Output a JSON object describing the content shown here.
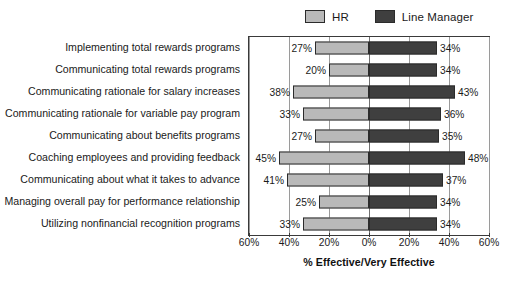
{
  "chart_data": {
    "type": "bar",
    "orientation": "horizontal-diverging",
    "title": "",
    "subtitle": "",
    "xlabel": "% Effective/Very Effective",
    "ylabel": "",
    "xlim": [
      -60,
      60
    ],
    "xticks": [
      60,
      40,
      20,
      0,
      20,
      40,
      60
    ],
    "xtick_labels": [
      "60%",
      "40%",
      "20%",
      "0%",
      "20%",
      "40%",
      "60%"
    ],
    "grid": true,
    "legend_position": "top-right",
    "categories": [
      "Implementing total rewards programs",
      "Communicating total rewards programs",
      "Communicating rationale for salary increases",
      "Communicating rationale for variable pay program",
      "Communicating about benefits programs",
      "Coaching employees and providing feedback",
      "Communicating about what it takes to advance",
      "Managing overall pay for performance relationship",
      "Utilizing nonfinancial recognition programs"
    ],
    "series": [
      {
        "name": "HR",
        "direction": "left",
        "color": "#b9b9b9",
        "values": [
          27,
          20,
          38,
          33,
          27,
          45,
          41,
          25,
          33
        ],
        "labels": [
          "27%",
          "20%",
          "38%",
          "33%",
          "27%",
          "45%",
          "41%",
          "25%",
          "33%"
        ]
      },
      {
        "name": "Line Manager",
        "direction": "right",
        "color": "#3f3f3f",
        "values": [
          34,
          34,
          43,
          36,
          35,
          48,
          37,
          34,
          34
        ],
        "labels": [
          "34%",
          "34%",
          "43%",
          "36%",
          "35%",
          "48%",
          "37%",
          "34%",
          "34%"
        ]
      }
    ]
  },
  "legend": {
    "items": [
      {
        "label": "HR",
        "color": "#b9b9b9"
      },
      {
        "label": "Line Manager",
        "color": "#3f3f3f"
      }
    ]
  }
}
